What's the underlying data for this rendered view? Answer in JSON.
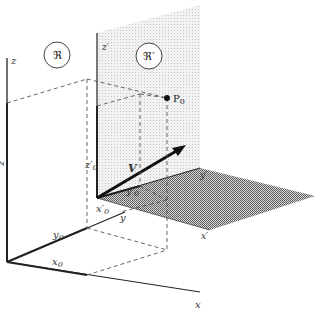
{
  "diagram": {
    "frames": [
      {
        "id": "R",
        "label": "ℜ",
        "description": "stationary frame"
      },
      {
        "id": "R-prime",
        "label": "ℜ′",
        "description": "moving frame"
      }
    ],
    "axes_R": {
      "x": "x",
      "y": "y",
      "z": "z"
    },
    "axes_R_prime": {
      "x": "x′",
      "y": "y′",
      "z": "z′"
    },
    "coordinates_R": {
      "x0": "x",
      "y0": "y",
      "z0": "z",
      "sub": "0"
    },
    "coordinates_R_prime": {
      "x0": "x′",
      "y0": "y′",
      "z0": "z′",
      "sub": "0"
    },
    "point": {
      "label": "P",
      "sub": "0"
    },
    "velocity": {
      "label": "V"
    },
    "colors": {
      "line": "#222222",
      "dash": "#555555",
      "plane_vertical": "#e6e6e6",
      "plane_horizontal": "#9a9a9a"
    }
  }
}
